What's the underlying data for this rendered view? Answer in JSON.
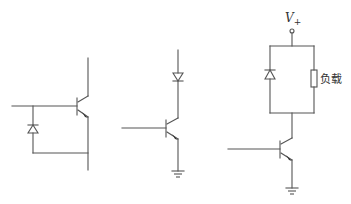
{
  "figure": {
    "circuits": [
      {
        "id": "circuit-1",
        "description": "NPN transistor with anti-parallel diode between base and emitter",
        "components": [
          "npn-transistor",
          "diode"
        ]
      },
      {
        "id": "circuit-2",
        "description": "NPN transistor with series diode in collector and grounded emitter",
        "components": [
          "diode",
          "npn-transistor",
          "ground"
        ]
      },
      {
        "id": "circuit-3",
        "description": "NPN transistor driving load with flyback diode in parallel to load",
        "components": [
          "supply-terminal",
          "diode",
          "load-resistor",
          "npn-transistor",
          "ground"
        ],
        "supply_label_main": "V",
        "supply_label_sub": "+",
        "load_label": "负载"
      }
    ],
    "colors": {
      "line": "#555555",
      "background": "#ffffff"
    }
  }
}
